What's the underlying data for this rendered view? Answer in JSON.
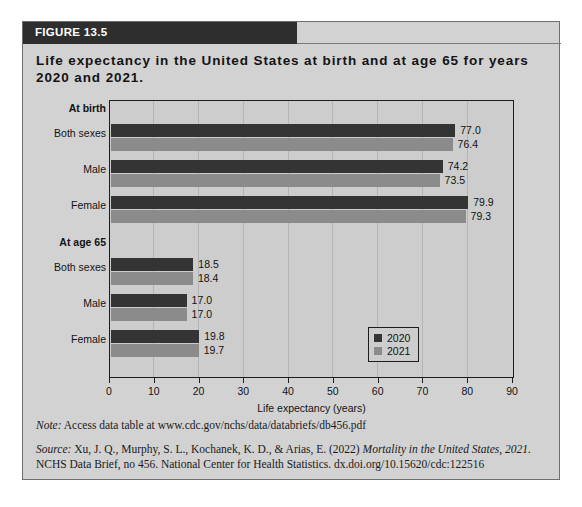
{
  "figure": {
    "header_label": "FIGURE 13.5",
    "title": "Life expectancy in the United States at birth and at age 65 for years 2020 and 2021.",
    "note_prefix": "Note:",
    "note_text": " Access data table at www.cdc.gov/nchs/data/databriefs/db456.pdf",
    "source_prefix": "Source:",
    "source_part1": " Xu, J. Q., Murphy, S. L., Kochanek, K. D., & Arias, E. (2022) ",
    "source_italic1": "Mortality in the United States, 2021.",
    "source_part2": " NCHS Data Brief, no 456. National Center for Health Statistics. dx.doi.org/10.15620/cdc:122516"
  },
  "colors": {
    "series_2020": "#343434",
    "series_2021": "#8b8b8b",
    "header_band": "#2e2e2e",
    "figure_background": "#d2d2d2",
    "plot_background": "#cdcdcd",
    "axis": "#1d1d1d"
  },
  "legend": {
    "position": "bottom-right",
    "entries": [
      {
        "label": "2020",
        "swatch": "y2020"
      },
      {
        "label": "2021",
        "swatch": "y2021"
      }
    ]
  },
  "chart_data": {
    "type": "bar",
    "orientation": "horizontal",
    "title": "Life expectancy in the United States at birth and at age 65 for years 2020 and 2021.",
    "xlabel": "Life expectancy (years)",
    "ylabel": "",
    "xlim": [
      0,
      90
    ],
    "xticks": [
      0,
      10,
      20,
      30,
      40,
      50,
      60,
      70,
      80,
      90
    ],
    "grid": true,
    "legend_position": "bottom-right",
    "groups": [
      {
        "name": "At birth",
        "categories": [
          "Both sexes",
          "Male",
          "Female"
        ],
        "series": [
          {
            "name": "2020",
            "values": [
              77.0,
              74.2,
              79.9
            ]
          },
          {
            "name": "2021",
            "values": [
              76.4,
              73.5,
              79.3
            ]
          }
        ]
      },
      {
        "name": "At age 65",
        "categories": [
          "Both sexes",
          "Male",
          "Female"
        ],
        "series": [
          {
            "name": "2020",
            "values": [
              18.5,
              17.0,
              19.8
            ]
          },
          {
            "name": "2021",
            "values": [
              18.4,
              17.0,
              19.7
            ]
          }
        ]
      }
    ],
    "bars": [
      {
        "group": "At birth",
        "category": "Both sexes",
        "series": "2020",
        "value": 77.0,
        "label": "77.0"
      },
      {
        "group": "At birth",
        "category": "Both sexes",
        "series": "2021",
        "value": 76.4,
        "label": "76.4"
      },
      {
        "group": "At birth",
        "category": "Male",
        "series": "2020",
        "value": 74.2,
        "label": "74.2"
      },
      {
        "group": "At birth",
        "category": "Male",
        "series": "2021",
        "value": 73.5,
        "label": "73.5"
      },
      {
        "group": "At birth",
        "category": "Female",
        "series": "2020",
        "value": 79.9,
        "label": "79.9"
      },
      {
        "group": "At birth",
        "category": "Female",
        "series": "2021",
        "value": 79.3,
        "label": "79.3"
      },
      {
        "group": "At age 65",
        "category": "Both sexes",
        "series": "2020",
        "value": 18.5,
        "label": "18.5"
      },
      {
        "group": "At age 65",
        "category": "Both sexes",
        "series": "2021",
        "value": 18.4,
        "label": "18.4"
      },
      {
        "group": "At age 65",
        "category": "Male",
        "series": "2020",
        "value": 17.0,
        "label": "17.0"
      },
      {
        "group": "At age 65",
        "category": "Male",
        "series": "2021",
        "value": 17.0,
        "label": "17.0"
      },
      {
        "group": "At age 65",
        "category": "Female",
        "series": "2020",
        "value": 19.8,
        "label": "19.8"
      },
      {
        "group": "At age 65",
        "category": "Female",
        "series": "2021",
        "value": 19.7,
        "label": "19.7"
      }
    ],
    "row_labels": [
      {
        "text": "At birth",
        "bold": true
      },
      {
        "text": "Both sexes",
        "bold": false
      },
      {
        "text": "Male",
        "bold": false
      },
      {
        "text": "Female",
        "bold": false
      },
      {
        "text": "At age 65",
        "bold": true
      },
      {
        "text": "Both sexes",
        "bold": false
      },
      {
        "text": "Male",
        "bold": false
      },
      {
        "text": "Female",
        "bold": false
      }
    ]
  }
}
